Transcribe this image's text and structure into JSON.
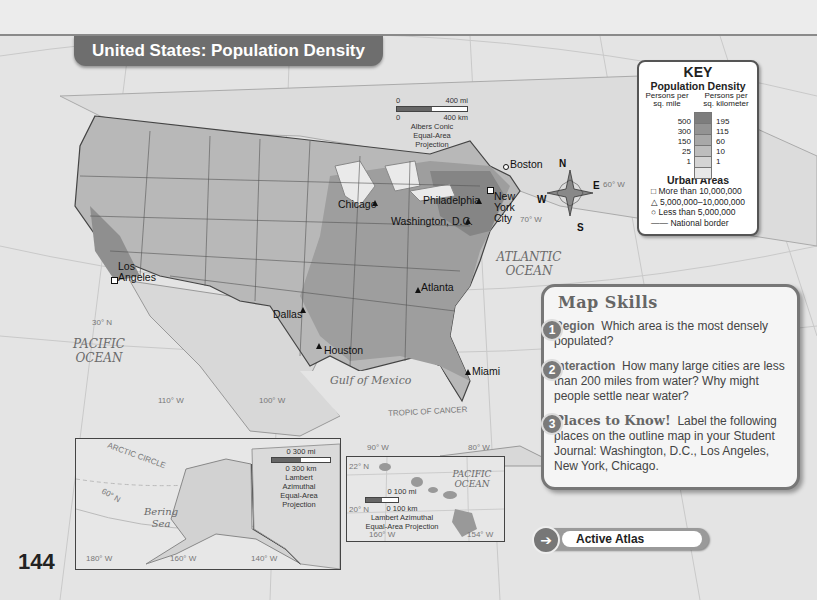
{
  "title": "United States: Population Density",
  "page_number": "144",
  "main_scale": {
    "top": "0",
    "top_end": "400 mi",
    "bottom": "0",
    "bottom_end": "400 km",
    "projection": "Albers Conic Equal-Area Projection"
  },
  "key": {
    "heading": "KEY",
    "subheading": "Population Density",
    "left_col": "Persons per sq. mile",
    "right_col": "Persons per sq. kilometer",
    "levels": [
      {
        "mile": "500",
        "km": "195",
        "color": "#7d7d7d"
      },
      {
        "mile": "300",
        "km": "115",
        "color": "#939393"
      },
      {
        "mile": "150",
        "km": "60",
        "color": "#a8a8a8"
      },
      {
        "mile": "25",
        "km": "10",
        "color": "#bdbdbd"
      },
      {
        "mile": "1",
        "km": "1",
        "color": "#d4d4d4"
      },
      {
        "mile": "",
        "km": "",
        "color": "#e8e8e8"
      }
    ],
    "urban_heading": "Urban Areas",
    "urban": [
      {
        "symbol": "square",
        "label": "More than 10,000,000"
      },
      {
        "symbol": "triangle",
        "label": "5,000,000–10,000,000"
      },
      {
        "symbol": "circle",
        "label": "Less than 5,000,000"
      },
      {
        "symbol": "line",
        "label": "National border"
      }
    ]
  },
  "cities": [
    {
      "name": "Boston",
      "symbol": "circle"
    },
    {
      "name": "New York City",
      "symbol": "square"
    },
    {
      "name": "Philadelphia",
      "symbol": "triangle"
    },
    {
      "name": "Washington, D.C.",
      "symbol": "triangle"
    },
    {
      "name": "Chicago",
      "symbol": "triangle"
    },
    {
      "name": "Los Angeles",
      "symbol": "square"
    },
    {
      "name": "Dallas",
      "symbol": "triangle"
    },
    {
      "name": "Houston",
      "symbol": "triangle"
    },
    {
      "name": "Atlanta",
      "symbol": "triangle"
    },
    {
      "name": "Miami",
      "symbol": "triangle"
    }
  ],
  "water_labels": {
    "atlantic": "ATLANTIC OCEAN",
    "pacific": "PACIFIC OCEAN",
    "gulf": "Gulf of Mexico",
    "bering": "Bering Sea",
    "pacific_inset": "PACIFIC OCEAN"
  },
  "grid_labels": {
    "lat30": "30° N",
    "lon110": "110° W",
    "lon100": "100° W",
    "lon90": "90° W",
    "lon80": "80° W",
    "lon70": "70° W",
    "lon60": "60° W",
    "tropic": "TROPIC OF CANCER",
    "arctic": "ARCTIC CIRCLE",
    "lat60": "60° N",
    "lon180": "180° W",
    "lon160": "160° W",
    "lon140": "140° W",
    "lat22": "22° N",
    "lat20": "20° N",
    "lon160h": "160° W",
    "lon154": "154° W"
  },
  "compass": {
    "n": "N",
    "s": "S",
    "e": "E",
    "w": "W"
  },
  "alaska_inset": {
    "scale_top": "0   300 mi",
    "scale_bottom": "0   300 km",
    "projection": "Lambert Azimuthal Equal-Area Projection"
  },
  "hawaii_inset": {
    "scale_top": "0   100 mi",
    "scale_bottom": "0   100 km",
    "projection": "Lambert Azimuthal Equal-Area Projection"
  },
  "map_skills": {
    "heading": "Map Skills",
    "questions": [
      {
        "num": "1",
        "title": "Region",
        "text": "Which area is the most densely populated?"
      },
      {
        "num": "2",
        "title": "Interaction",
        "text": "How many large cities are less than 200 miles from water? Why might people settle near water?"
      },
      {
        "num": "3",
        "title": "Places to Know!",
        "text": "Label the following places on the outline map in your Student Journal: Washington, D.C., Los Angeles, New York, Chicago."
      }
    ],
    "button_label": "Active Atlas"
  }
}
